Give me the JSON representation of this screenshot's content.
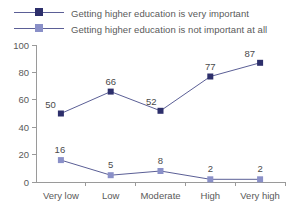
{
  "chart_data": {
    "type": "line",
    "title": "",
    "subtitle": "",
    "xlabel": "",
    "ylabel": "",
    "categories": [
      "Very low",
      "Low",
      "Moderate",
      "High",
      "Very high"
    ],
    "ylim": [
      0,
      100
    ],
    "ytick_labels": [
      "0",
      "20",
      "40",
      "60",
      "80",
      "100"
    ],
    "yticks": [
      0,
      20,
      40,
      60,
      80,
      100
    ],
    "grid": false,
    "legend_position": "top-left",
    "series": [
      {
        "name": "Getting higher education is very important",
        "values": [
          50,
          66,
          52,
          77,
          87
        ],
        "labels": [
          "50",
          "66",
          "52",
          "77",
          "87"
        ],
        "color": "#2d2f6b",
        "marker": "square"
      },
      {
        "name": "Getting higher education is not important at all",
        "values": [
          16,
          5,
          8,
          2,
          2
        ],
        "labels": [
          "16",
          "5",
          "8",
          "2",
          "2"
        ],
        "color": "#8a90c8",
        "marker": "square"
      }
    ],
    "line_color": "#5b5f96",
    "axis_color": "#9a9a9a",
    "text_color": "#5a5a5a",
    "background": "#ffffff"
  }
}
